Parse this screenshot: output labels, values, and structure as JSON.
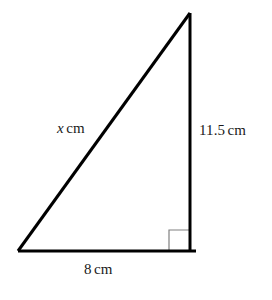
{
  "figure": {
    "name": "right-triangle-diagram",
    "background_color": "#ffffff",
    "stroke_color": "#000000",
    "stroke_width": 3,
    "right_angle_marker_color": "#808080",
    "right_angle_marker_stroke_width": 1,
    "vertices": {
      "apex": [
        190,
        13
      ],
      "bottom_left": [
        18,
        251
      ],
      "bottom_right": [
        190,
        251
      ]
    },
    "base_overhang_right": 6
  },
  "labels": {
    "hypotenuse": {
      "variable": "x",
      "unit": "cm",
      "full_text": "x cm"
    },
    "vertical_side": {
      "value": "11.5",
      "unit": "cm",
      "full_text": "11.5 cm"
    },
    "base_side": {
      "value": "8",
      "unit": "cm",
      "full_text": "8 cm"
    }
  },
  "markers": {
    "right_angle": {
      "name": "right-angle-marker",
      "size": 21,
      "corner": [
        190,
        251
      ]
    }
  }
}
